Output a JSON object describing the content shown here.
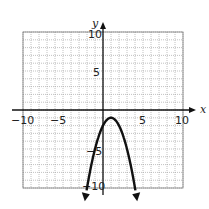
{
  "chart_data": {
    "type": "line",
    "title": "",
    "xlabel": "x",
    "ylabel": "y",
    "xlim": [
      -10,
      10
    ],
    "ylim": [
      -10,
      10
    ],
    "grid": true,
    "x_ticks": [
      "-10",
      "-5",
      "5",
      "10"
    ],
    "y_ticks": [
      "10",
      "5",
      "-5",
      "-10"
    ],
    "series": [
      {
        "name": "parabola",
        "equation": "y = -(x - 1)^2 - 1",
        "x": [
          -2,
          -1,
          0,
          1,
          2,
          3,
          4
        ],
        "y": [
          -10,
          -5,
          -2,
          -1,
          -2,
          -5,
          -10
        ],
        "vertex": [
          1,
          -1
        ],
        "arrows": "both ends"
      }
    ]
  },
  "labels": {
    "x_axis": "x",
    "y_axis": "y",
    "x_neg10": "−10",
    "x_neg5": "−5",
    "x_5": "5",
    "x_10": "10",
    "y_10": "10",
    "y_5": "5",
    "y_neg5": "−5",
    "y_neg10": "−10"
  }
}
